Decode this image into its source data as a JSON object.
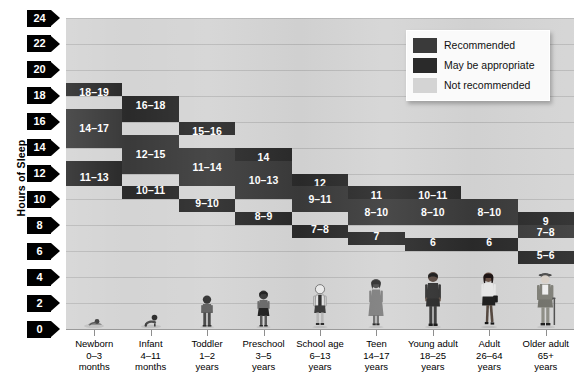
{
  "axis": {
    "y_title": "Hours of Sleep",
    "y_ticks": [
      "24",
      "22",
      "20",
      "18",
      "16",
      "14",
      "12",
      "10",
      "8",
      "6",
      "4",
      "2",
      "0"
    ],
    "y_min": 0,
    "y_max": 24,
    "y_step": 2
  },
  "legend": {
    "items": [
      {
        "label": "Recommended",
        "color": "#3a3a3a",
        "icon": "color-swatch"
      },
      {
        "label": "May be appropriate",
        "color": "#2a2a2a",
        "icon": "color-swatch"
      },
      {
        "label": "Not recommended",
        "color": "#d4d4d4",
        "icon": "color-swatch"
      }
    ]
  },
  "chart_data": {
    "type": "bar",
    "title": "",
    "xlabel": "",
    "ylabel": "Hours of Sleep",
    "ylim": [
      0,
      24
    ],
    "grid": true,
    "legend_position": "top-right",
    "categories": [
      "Newborn 0–3 months",
      "Infant 4–11 months",
      "Toddler 1–2 years",
      "Preschool 3–5 years",
      "School age 6–13 years",
      "Teen 14–17 years",
      "Young adult 18–25 years",
      "Adult 26–64 years",
      "Older adult 65+ years"
    ],
    "groups": [
      {
        "name": "Newborn",
        "age": "0–3",
        "unit": "months",
        "figure": "baby-lying-icon",
        "may_upper": {
          "label": "18–19",
          "from": 18,
          "to": 19
        },
        "recommended": {
          "label": "14–17",
          "from": 14,
          "to": 17
        },
        "may_lower": {
          "label": "11–13",
          "from": 11,
          "to": 13
        },
        "total_from": 11,
        "total_to": 19
      },
      {
        "name": "Infant",
        "age": "4–11",
        "unit": "months",
        "figure": "baby-crawling-icon",
        "may_upper": {
          "label": "16–18",
          "from": 16,
          "to": 18
        },
        "recommended": {
          "label": "12–15",
          "from": 12,
          "to": 15
        },
        "may_lower": {
          "label": "10–11",
          "from": 10,
          "to": 11
        },
        "total_from": 10,
        "total_to": 18
      },
      {
        "name": "Toddler",
        "age": "1–2",
        "unit": "years",
        "figure": "toddler-standing-icon",
        "may_upper": {
          "label": "15–16",
          "from": 15,
          "to": 16
        },
        "recommended": {
          "label": "11–14",
          "from": 11,
          "to": 14
        },
        "may_lower": {
          "label": "9–10",
          "from": 9,
          "to": 10
        },
        "total_from": 9,
        "total_to": 16
      },
      {
        "name": "Preschool",
        "age": "3–5",
        "unit": "years",
        "figure": "preschooler-standing-icon",
        "may_upper": {
          "label": "14",
          "from": 13,
          "to": 14
        },
        "recommended": {
          "label": "10–13",
          "from": 10,
          "to": 13
        },
        "may_lower": {
          "label": "8–9",
          "from": 8,
          "to": 9
        },
        "total_from": 8,
        "total_to": 14
      },
      {
        "name": "School age",
        "age": "6–13",
        "unit": "years",
        "figure": "schoolchild-standing-icon",
        "may_upper": {
          "label": "12",
          "from": 11,
          "to": 12
        },
        "recommended": {
          "label": "9–11",
          "from": 9,
          "to": 11
        },
        "may_lower": {
          "label": "7–8",
          "from": 7,
          "to": 8
        },
        "total_from": 7,
        "total_to": 12
      },
      {
        "name": "Teen",
        "age": "14–17",
        "unit": "years",
        "figure": "teen-standing-icon",
        "may_upper": {
          "label": "11",
          "from": 10,
          "to": 11
        },
        "recommended": {
          "label": "8–10",
          "from": 8,
          "to": 10
        },
        "may_lower": {
          "label": "7",
          "from": 6.5,
          "to": 7.5
        },
        "total_from": 6.5,
        "total_to": 11
      },
      {
        "name": "Young adult",
        "age": "18–25",
        "unit": "years",
        "figure": "young-adult-man-icon",
        "may_upper": {
          "label": "10–11",
          "from": 10,
          "to": 11
        },
        "recommended": {
          "label": "8–10",
          "from": 8,
          "to": 10
        },
        "may_lower": {
          "label": "6",
          "from": 6,
          "to": 7
        },
        "total_from": 6,
        "total_to": 11
      },
      {
        "name": "Adult",
        "age": "26–64",
        "unit": "years",
        "figure": "adult-woman-icon",
        "may_upper": {
          "label": "10",
          "from": 9,
          "to": 10
        },
        "recommended": {
          "label": "8–10",
          "from": 8,
          "to": 10
        },
        "may_lower": {
          "label": "6",
          "from": 6,
          "to": 7
        },
        "total_from": 6,
        "total_to": 10
      },
      {
        "name": "Older adult",
        "age": "65+",
        "unit": "years",
        "figure": "older-adult-man-icon",
        "may_upper": {
          "label": "9",
          "from": 8,
          "to": 9
        },
        "recommended": {
          "label": "7–8",
          "from": 7,
          "to": 8
        },
        "may_lower": {
          "label": "5–6",
          "from": 5,
          "to": 6
        },
        "total_from": 5,
        "total_to": 9
      }
    ]
  },
  "colors": {
    "recommended": "#3a3a3a",
    "may_be_appropriate": "#2a2a2a",
    "not_recommended": "#d4d4d4",
    "axis": "#000000",
    "gridline": "#b9b9b9"
  }
}
